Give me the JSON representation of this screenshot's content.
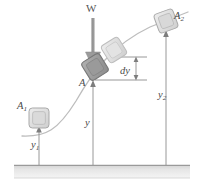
{
  "figure": {
    "labels": {
      "weight": "W",
      "block_current": "A",
      "block_initial": "A₁",
      "block_final": "A₂",
      "height_current": "y",
      "height_initial": "y₁",
      "height_final": "y₂",
      "differential_height": "dy"
    },
    "label_parts": {
      "A_sub1_base": "A",
      "A_sub1_sub": "1",
      "A_sub2_base": "A",
      "A_sub2_sub": "2",
      "y_sub1_base": "y",
      "y_sub1_sub": "1",
      "y_sub2_base": "y",
      "y_sub2_sub": "2",
      "y_plain": "y",
      "dy_text": "dy",
      "W_text": "W",
      "A_plain": "A"
    },
    "colors": {
      "background": "#ffffff",
      "curve": "#b8b8b8",
      "ground_fill_top": "#d6d6d6",
      "ground_fill_bottom": "#f2f2f2",
      "ground_edge": "#9a9a9a",
      "dimension_line": "#8c8c8c",
      "weight_arrow": "#9a9a9a",
      "block_light_fill": "#e2e2e2",
      "block_light_stroke": "#b0b0b0",
      "block_dark_fill": "#9f9f9f",
      "block_dark_stroke": "#7a7a7a",
      "text": "#4a4a4a"
    },
    "geometry": {
      "ground_top_y": 165,
      "ground_bottom_y": 178,
      "curve_path": "M 22 135 C 48 136, 60 128, 78 98 C 96 68, 118 40, 160 22 L 186 14",
      "blocks": [
        {
          "name": "block-A1",
          "cx": 39,
          "cy": 118,
          "size": 20,
          "rotation": 0,
          "shade": "light"
        },
        {
          "name": "block-A-ghost",
          "cx": 114,
          "cy": 50,
          "size": 20,
          "rotation": -32,
          "shade": "light"
        },
        {
          "name": "block-A",
          "cx": 95,
          "cy": 67,
          "size": 21,
          "rotation": -32,
          "shade": "dark"
        },
        {
          "name": "block-A2",
          "cx": 166,
          "cy": 21,
          "size": 20,
          "rotation": -20,
          "shade": "light"
        }
      ],
      "dimension_lines": [
        {
          "name": "dim-y1",
          "x": 39,
          "y_top": 128,
          "y_bottom": 165
        },
        {
          "name": "dim-y",
          "x": 93,
          "y_top": 83,
          "y_bottom": 165
        },
        {
          "name": "dim-y2",
          "x": 166,
          "y_top": 33,
          "y_bottom": 165
        }
      ],
      "dy_marker": {
        "x": 136,
        "y_top": 57,
        "y_bottom": 80,
        "tick_left_top": 112,
        "tick_right_top": 146,
        "tick_left_bottom": 96,
        "tick_right_bottom": 146
      },
      "weight_arrow": {
        "x": 93,
        "y_top": 18,
        "y_bottom": 62
      }
    }
  }
}
